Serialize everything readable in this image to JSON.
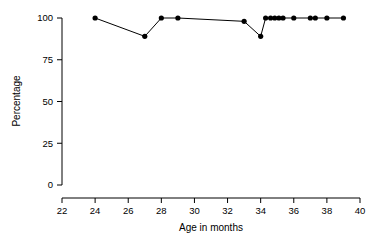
{
  "chart_data": {
    "type": "line",
    "title": "",
    "subtitle": "",
    "xlabel": "Age in months",
    "ylabel": "Percentage",
    "xlim": [
      22,
      40
    ],
    "ylim": [
      0,
      100
    ],
    "xticks": [
      22,
      24,
      26,
      28,
      30,
      32,
      34,
      36,
      38,
      40
    ],
    "xticklabels": [
      "22",
      "24",
      "26",
      "28",
      "30",
      "32",
      "34",
      "36",
      "38",
      "40"
    ],
    "yticks": [
      0,
      25,
      50,
      75,
      100
    ],
    "yticklabels": [
      "0",
      "25",
      "50",
      "75",
      "100"
    ],
    "grid": false,
    "legend": null,
    "marker": "filled-circle",
    "line_color": "#000000",
    "marker_color": "#000000",
    "series": [
      {
        "name": "percentage",
        "x": [
          24.0,
          27.0,
          28.0,
          29.0,
          33.0,
          34.0,
          34.3,
          34.6,
          34.85,
          35.1,
          35.35,
          36.0,
          37.0,
          37.3,
          38.0,
          39.0
        ],
        "y": [
          100,
          89,
          100,
          100,
          98,
          89,
          100,
          100,
          100,
          100,
          100,
          100,
          100,
          100,
          100,
          100
        ],
        "points": [
          {
            "x": 24.0,
            "y": 100
          },
          {
            "x": 27.0,
            "y": 89
          },
          {
            "x": 28.0,
            "y": 100
          },
          {
            "x": 29.0,
            "y": 100
          },
          {
            "x": 33.0,
            "y": 98
          },
          {
            "x": 34.0,
            "y": 89
          },
          {
            "x": 34.3,
            "y": 100
          },
          {
            "x": 34.6,
            "y": 100
          },
          {
            "x": 34.85,
            "y": 100
          },
          {
            "x": 35.1,
            "y": 100
          },
          {
            "x": 35.35,
            "y": 100
          },
          {
            "x": 36.0,
            "y": 100
          },
          {
            "x": 37.0,
            "y": 100
          },
          {
            "x": 37.3,
            "y": 100
          },
          {
            "x": 38.0,
            "y": 100
          },
          {
            "x": 39.0,
            "y": 100
          }
        ]
      }
    ]
  },
  "axes": {
    "x_title": "Age in months",
    "y_title": "Percentage"
  }
}
